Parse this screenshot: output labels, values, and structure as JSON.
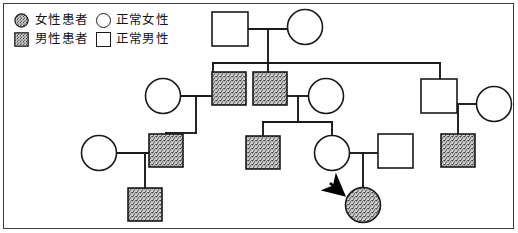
{
  "figure": {
    "kind": "pedigree-chart",
    "border": true,
    "width": 518,
    "height": 233
  },
  "legend": {
    "rows": [
      {
        "affected_symbol": "filled-circle-icon",
        "affected_label": "女性患者",
        "normal_symbol": "open-circle-icon",
        "normal_label": "正常女性"
      },
      {
        "affected_symbol": "filled-square-icon",
        "affected_label": "男性患者",
        "normal_symbol": "open-square-icon",
        "normal_label": "正常男性"
      }
    ]
  },
  "colors": {
    "line": "#1a1a1a",
    "fill_affected": "#a8a8a8",
    "fill_normal": "#ffffff",
    "border": "#3a3a3a",
    "arrow": "#000000"
  },
  "pedigree": {
    "proband_marker": "arrow-icon",
    "individuals": [
      {
        "id": "I-1",
        "sex": "male",
        "affected": false,
        "shape": "square",
        "x": 230,
        "y": 29
      },
      {
        "id": "I-2",
        "sex": "female",
        "affected": false,
        "shape": "circle",
        "x": 305,
        "y": 27
      },
      {
        "id": "II-1",
        "sex": "female",
        "affected": false,
        "shape": "circle",
        "x": 163,
        "y": 96
      },
      {
        "id": "II-2",
        "sex": "male",
        "affected": true,
        "shape": "square",
        "x": 229,
        "y": 89
      },
      {
        "id": "II-3",
        "sex": "male",
        "affected": true,
        "shape": "square",
        "x": 270,
        "y": 89
      },
      {
        "id": "II-4",
        "sex": "female",
        "affected": false,
        "shape": "circle",
        "x": 326,
        "y": 96
      },
      {
        "id": "II-5",
        "sex": "male",
        "affected": false,
        "shape": "square",
        "x": 439,
        "y": 96
      },
      {
        "id": "II-6",
        "sex": "female",
        "affected": false,
        "shape": "circle",
        "x": 494,
        "y": 104
      },
      {
        "id": "III-1",
        "sex": "female",
        "affected": false,
        "shape": "circle",
        "x": 99,
        "y": 153
      },
      {
        "id": "III-2",
        "sex": "male",
        "affected": true,
        "shape": "square",
        "x": 166,
        "y": 150
      },
      {
        "id": "III-3",
        "sex": "male",
        "affected": true,
        "shape": "square",
        "x": 263,
        "y": 152
      },
      {
        "id": "III-4",
        "sex": "female",
        "affected": false,
        "shape": "circle",
        "x": 332,
        "y": 153
      },
      {
        "id": "III-5",
        "sex": "male",
        "affected": false,
        "shape": "square",
        "x": 395,
        "y": 150
      },
      {
        "id": "III-6",
        "sex": "male",
        "affected": true,
        "shape": "square",
        "x": 458,
        "y": 150
      },
      {
        "id": "IV-1",
        "sex": "male",
        "affected": true,
        "shape": "square",
        "x": 145,
        "y": 203
      },
      {
        "id": "IV-2",
        "sex": "female",
        "affected": true,
        "shape": "circle",
        "x": 363,
        "y": 205,
        "proband": true
      }
    ]
  }
}
